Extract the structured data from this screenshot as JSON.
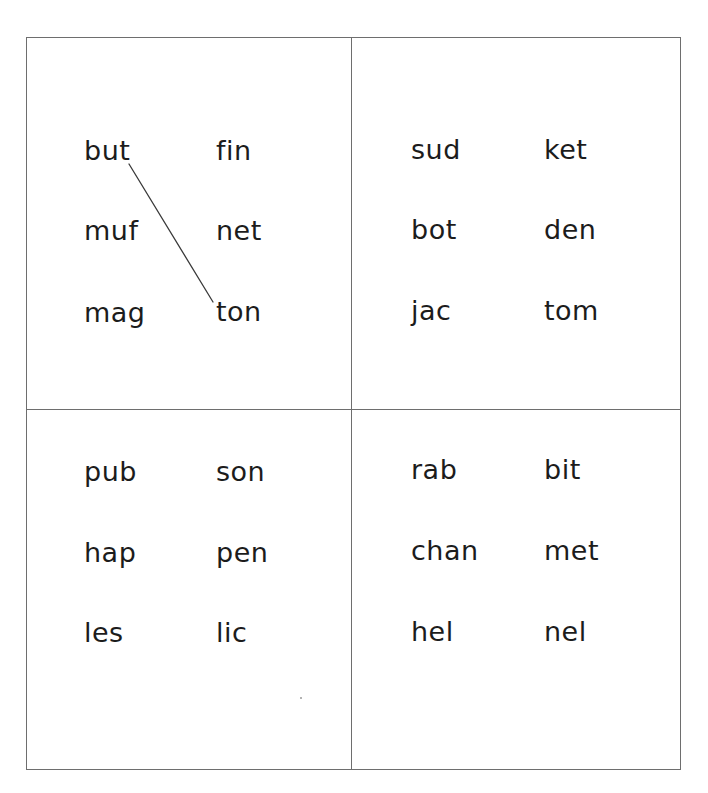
{
  "worksheet": {
    "type": "word matching worksheet",
    "panels": [
      {
        "position": "top-left",
        "left_column": [
          "but",
          "muf",
          "mag"
        ],
        "right_column": [
          "fin",
          "net",
          "ton"
        ]
      },
      {
        "position": "top-right",
        "left_column": [
          "sud",
          "bot",
          "jac"
        ],
        "right_column": [
          "ket",
          "den",
          "tom"
        ]
      },
      {
        "position": "bottom-left",
        "left_column": [
          "pub",
          "hap",
          "les"
        ],
        "right_column": [
          "son",
          "pen",
          "lic"
        ]
      },
      {
        "position": "bottom-right",
        "left_column": [
          "rab",
          "chan",
          "hel"
        ],
        "right_column": [
          "bit",
          "met",
          "nel"
        ]
      }
    ],
    "connections": [
      {
        "panel": "top-left",
        "from": "but",
        "to": "ton"
      }
    ],
    "colors": {
      "border": "#6e6e6e",
      "text": "#1c1c1c",
      "line": "#3a3a3a",
      "background": "#ffffff"
    }
  }
}
